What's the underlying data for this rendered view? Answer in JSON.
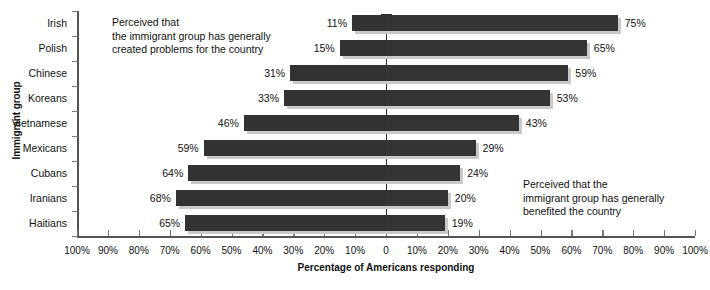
{
  "chart_data": {
    "type": "bar",
    "orientation": "horizontal-diverging",
    "title": "",
    "xlabel": "Percentage of Americans responding",
    "ylabel": "Immigrant group",
    "categories": [
      "Irish",
      "Polish",
      "Chinese",
      "Koreans",
      "Vietnamese",
      "Mexicans",
      "Cubans",
      "Iranians",
      "Haitians"
    ],
    "series": [
      {
        "name": "Perceived that the immigrant group has generally created problems for the country",
        "side": "left",
        "values": [
          11,
          15,
          31,
          33,
          46,
          59,
          64,
          68,
          65
        ],
        "labels": [
          "11%",
          "15%",
          "31%",
          "33%",
          "46%",
          "59%",
          "64%",
          "68%",
          "65%"
        ],
        "color": "#323232"
      },
      {
        "name": "Perceived that the immigrant group has generally benefited the country",
        "side": "right",
        "values": [
          75,
          65,
          59,
          53,
          43,
          29,
          24,
          20,
          19
        ],
        "labels": [
          "75%",
          "65%",
          "59%",
          "53%",
          "43%",
          "29%",
          "24%",
          "20%",
          "19%"
        ],
        "color": "#343434"
      }
    ],
    "xlim": [
      -100,
      100
    ],
    "xticks": [
      -100,
      -90,
      -80,
      -70,
      -60,
      -50,
      -40,
      -30,
      -20,
      -10,
      0,
      10,
      20,
      30,
      40,
      50,
      60,
      70,
      80,
      90,
      100
    ],
    "xtick_labels": [
      "100%",
      "90%",
      "80%",
      "70%",
      "60%",
      "50%",
      "40%",
      "30%",
      "20%",
      "10%",
      "0",
      "10%",
      "20%",
      "30%",
      "40%",
      "50%",
      "60%",
      "70%",
      "80%",
      "90%",
      "100%"
    ],
    "grid": false,
    "legend": "none",
    "annotations": [
      {
        "id": "left",
        "text": "Perceived that\nthe immigrant group has generally\ncreated problems for the country"
      },
      {
        "id": "right",
        "text": "Perceived that the\nimmigrant group has generally\nbenefited the country"
      }
    ]
  },
  "axes": {
    "y_title": "Immigrant group",
    "x_title": "Percentage of Americans responding"
  },
  "colors": {
    "bar": "#323232",
    "shadow": "#c9c9c9",
    "axis": "#555555",
    "zero_line": "#2a2a2a",
    "text": "#111111",
    "background": "#ffffff"
  }
}
